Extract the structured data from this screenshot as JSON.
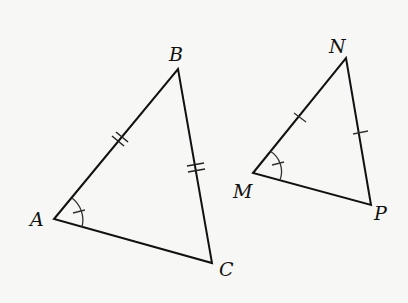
{
  "diagram": {
    "type": "congruent-triangles",
    "triangles": [
      {
        "name": "triangle-ABC",
        "vertices": {
          "A": [
            54,
            219
          ],
          "B": [
            178,
            69
          ],
          "C": [
            212,
            263
          ]
        },
        "labels": {
          "A": "A",
          "B": "B",
          "C": "C"
        },
        "marks": {
          "AB": "double-tick",
          "BC": "double-tick",
          "angle_A": "arc-with-tick"
        }
      },
      {
        "name": "triangle-MNP",
        "vertices": {
          "M": [
            253,
            173
          ],
          "N": [
            346,
            58
          ],
          "P": [
            371,
            205
          ]
        },
        "labels": {
          "M": "M",
          "N": "N",
          "P": "P"
        },
        "marks": {
          "MN": "single-tick",
          "NP": "single-tick",
          "angle_M": "arc-with-tick"
        }
      }
    ],
    "stroke_color": "#111111"
  }
}
